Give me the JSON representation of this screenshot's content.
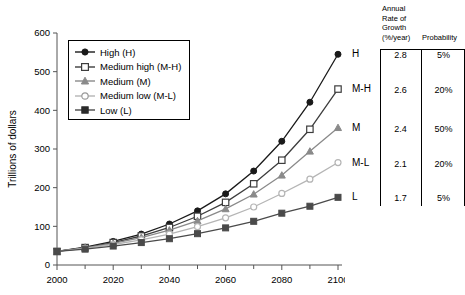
{
  "chart_data": {
    "type": "line",
    "title": "",
    "xlabel": "",
    "ylabel": "Trillions of dollars",
    "x": [
      2000,
      2010,
      2020,
      2030,
      2040,
      2050,
      2060,
      2070,
      2080,
      2090,
      2100
    ],
    "xlim": [
      2000,
      2100
    ],
    "ylim": [
      0,
      600
    ],
    "xticks": [
      2000,
      2020,
      2040,
      2060,
      2080,
      2100
    ],
    "xtick_labels": [
      "2000",
      "2020",
      "2040",
      "2060",
      "2080",
      "2100"
    ],
    "xminorticks": [
      2010,
      2030,
      2050,
      2070,
      2090
    ],
    "yticks": [
      0,
      100,
      200,
      300,
      400,
      500,
      600
    ],
    "ytick_labels": [
      "0",
      "100",
      "200",
      "300",
      "400",
      "500",
      "600"
    ],
    "grid": false,
    "legend_position": "upper left",
    "series": [
      {
        "name": "High (H)",
        "key": "H",
        "marker": "filled-circle",
        "color": "#1a1a1a",
        "growth_rate": "2.8",
        "probability": "5%",
        "values": [
          35,
          46,
          61,
          80,
          106,
          140,
          184,
          243,
          320,
          421,
          545
        ]
      },
      {
        "name": "Medium high (M-H)",
        "key": "M-H",
        "marker": "open-square",
        "color": "#3d3d3d",
        "growth_rate": "2.6",
        "probability": "20%",
        "values": [
          35,
          45,
          58,
          75,
          97,
          126,
          162,
          210,
          271,
          351,
          455
        ]
      },
      {
        "name": "Medium (M)",
        "key": "M",
        "marker": "filled-triangle",
        "color": "#8a8a8a",
        "growth_rate": "2.4",
        "probability": "50%",
        "values": [
          35,
          44,
          56,
          71,
          90,
          114,
          145,
          183,
          232,
          294,
          355
        ]
      },
      {
        "name": "Medium low (M-L)",
        "key": "M-L",
        "marker": "open-circle",
        "color": "#b5b5b5",
        "growth_rate": "2.1",
        "probability": "20%",
        "values": [
          35,
          43,
          53,
          65,
          80,
          99,
          122,
          150,
          185,
          222,
          265
        ]
      },
      {
        "name": "Low (L)",
        "key": "L",
        "marker": "filled-square",
        "color": "#4a4a4a",
        "growth_rate": "1.7",
        "probability": "5%",
        "values": [
          35,
          41,
          49,
          58,
          68,
          81,
          96,
          113,
          134,
          152,
          175
        ]
      }
    ]
  },
  "legend": {
    "items": [
      {
        "label": "High (H)"
      },
      {
        "label": "Medium high (M-H)"
      },
      {
        "label": "Medium (M)"
      },
      {
        "label": "Medium low (M-L)"
      },
      {
        "label": "Low (L)"
      }
    ]
  },
  "table": {
    "header_left_lines": [
      "Annual",
      "Rate of",
      "Growth",
      "(%/year)"
    ],
    "header_right": "Probability",
    "rows": [
      {
        "key": "H",
        "rate": "2.8",
        "probability": "5%"
      },
      {
        "key": "M-H",
        "rate": "2.6",
        "probability": "20%"
      },
      {
        "key": "M",
        "rate": "2.4",
        "probability": "50%"
      },
      {
        "key": "M-L",
        "rate": "2.1",
        "probability": "20%"
      },
      {
        "key": "L",
        "rate": "1.7",
        "probability": "5%"
      }
    ]
  },
  "axis": {
    "y_title": "Trillions of dollars"
  }
}
